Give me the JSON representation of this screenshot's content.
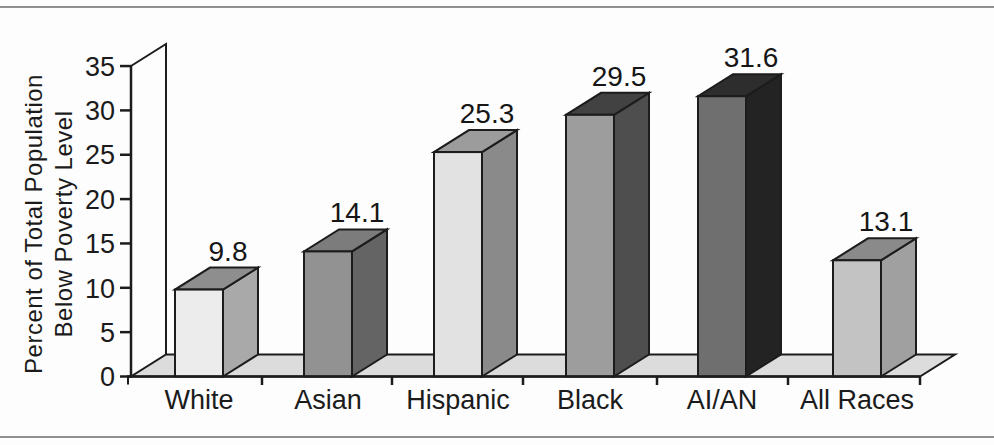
{
  "page": {
    "background": "#fdfdfd",
    "rule_color": "#8f8f8f",
    "text_color": "#1b1b1b"
  },
  "chart_data": {
    "type": "bar",
    "style": "3d-column-grayscale",
    "title": "",
    "xlabel": "",
    "ylabel": "Percent of Total Population Below Poverty Level",
    "ylabel_lines": [
      "Percent of Total Population",
      "Below Poverty Level"
    ],
    "categories": [
      "White",
      "Asian",
      "Hispanic",
      "Black",
      "AI/AN",
      "All Races"
    ],
    "values": [
      9.8,
      14.1,
      25.3,
      29.5,
      31.6,
      13.1
    ],
    "value_labels": [
      "9.8",
      "14.1",
      "25.3",
      "29.5",
      "31.6",
      "13.1"
    ],
    "ylim": [
      0,
      35
    ],
    "y_ticks": [
      0,
      5,
      10,
      15,
      20,
      25,
      30,
      35
    ],
    "grid": false,
    "legend": "none",
    "outline_color": "#1c1c1c",
    "floor_color": "#dcdcdc",
    "wall_color": "#ffffff",
    "bar_colors": [
      {
        "front": "#ececec",
        "top": "#8e8e8e",
        "side": "#a9a9a9"
      },
      {
        "front": "#929292",
        "top": "#7c7c7c",
        "side": "#646464"
      },
      {
        "front": "#e2e2e2",
        "top": "#9c9c9c",
        "side": "#8a8a8a"
      },
      {
        "front": "#9d9d9d",
        "top": "#424242",
        "side": "#4e4e4e"
      },
      {
        "front": "#6f6f6f",
        "top": "#2d2d2d",
        "side": "#232323"
      },
      {
        "front": "#c3c3c3",
        "top": "#8a8a8a",
        "side": "#a0a0a0"
      }
    ]
  }
}
